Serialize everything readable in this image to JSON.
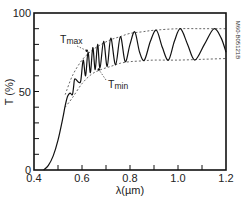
{
  "chart_data": {
    "type": "line",
    "title": "",
    "xlabel": "λ(µm)",
    "ylabel": "T (%)",
    "xlim": [
      0.4,
      1.2
    ],
    "ylim": [
      0,
      100
    ],
    "x_ticks": [
      0.4,
      0.6,
      0.8,
      1.0,
      1.2
    ],
    "x_tick_labels": [
      "0.4",
      "0.6",
      "0.8",
      "1.0",
      "1.2"
    ],
    "x_minor_step": 0.1,
    "y_ticks": [
      0,
      50,
      100
    ],
    "y_tick_labels": [
      "0",
      "50",
      "100"
    ],
    "y_minor_step": 10,
    "grid": false,
    "legend": null,
    "side_label": "M60-B05121B",
    "annotations": [
      {
        "text": "T",
        "sub": "max",
        "target": [
          0.62,
          76
        ]
      },
      {
        "text": "T",
        "sub": "min",
        "target": [
          0.67,
          64
        ]
      }
    ],
    "series": [
      {
        "name": "T (transmission)",
        "style": "solid",
        "x": [
          0.44,
          0.46,
          0.48,
          0.5,
          0.52,
          0.53,
          0.54,
          0.55,
          0.56,
          0.565,
          0.57,
          0.585,
          0.595,
          0.605,
          0.615,
          0.625,
          0.635,
          0.645,
          0.655,
          0.665,
          0.675,
          0.69,
          0.705,
          0.72,
          0.74,
          0.76,
          0.78,
          0.8,
          0.82,
          0.84,
          0.86,
          0.885,
          0.91,
          0.935,
          0.96,
          0.985,
          1.01,
          1.04,
          1.07,
          1.11,
          1.15,
          1.18,
          1.2
        ],
        "y": [
          0,
          3,
          9,
          19,
          33,
          41,
          47,
          49,
          48,
          53,
          58,
          56,
          57,
          70,
          60,
          75,
          62,
          78,
          64,
          80,
          65,
          82,
          66,
          84,
          67,
          85,
          69,
          80,
          88,
          75,
          70,
          82,
          89,
          78,
          70,
          82,
          90,
          80,
          70,
          80,
          90,
          84,
          75
        ]
      },
      {
        "name": "Tmax envelope",
        "style": "dashed",
        "x": [
          0.53,
          0.56,
          0.6,
          0.64,
          0.68,
          0.72,
          0.76,
          0.8,
          0.85,
          0.9,
          1.0,
          1.1,
          1.2
        ],
        "y": [
          48,
          60,
          70,
          76,
          80,
          83,
          85,
          87,
          88,
          89,
          90,
          90,
          90
        ]
      },
      {
        "name": "Tmin envelope",
        "style": "dashed",
        "x": [
          0.53,
          0.56,
          0.6,
          0.64,
          0.68,
          0.72,
          0.76,
          0.8,
          0.85,
          0.9,
          1.0,
          1.1,
          1.2
        ],
        "y": [
          40,
          46,
          55,
          61,
          64,
          66,
          68,
          69,
          69.5,
          70,
          70,
          70.5,
          71
        ]
      }
    ]
  }
}
